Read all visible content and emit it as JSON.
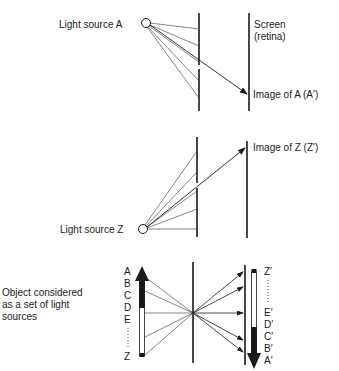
{
  "caption_cropped": "",
  "panel_a": {
    "source_label": "Light source A",
    "screen_label_line1": "Screen",
    "screen_label_line2": "(retina)",
    "image_label": "Image of A (A′)"
  },
  "panel_z": {
    "source_label": "Light source Z",
    "image_label": "Image of Z (Z′)"
  },
  "panel_object": {
    "description_line1": "Object considered",
    "description_line2": "as a set of light",
    "description_line3": "sources",
    "object_points": [
      "A",
      "B",
      "C",
      "D",
      "E",
      "Z"
    ],
    "image_points": [
      "Z′",
      "E′",
      "D′",
      "C′",
      "B′",
      "A′"
    ]
  },
  "icons": {
    "light_source": "circle-icon",
    "ray_arrow": "arrow-icon",
    "object_arrow": "upward-arrow-icon",
    "image_arrow": "downward-arrow-icon"
  },
  "colors": {
    "ink": "#1a1a1a",
    "ray": "#333333",
    "background": "#ffffff"
  }
}
